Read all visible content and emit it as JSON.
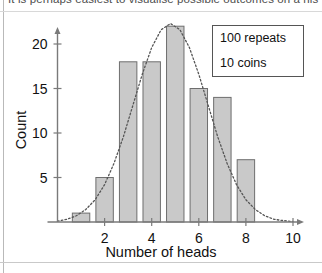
{
  "caption": {
    "text": "It is perhaps easiest to visualise possible outcomes on a his"
  },
  "legend": {
    "line1": "100 repeats",
    "line2": "10 coins"
  },
  "colors": {
    "bar_fill": "#c9c9c9",
    "bar_stroke": "#6e6e6e",
    "axis": "#7a7a7a",
    "curve": "#555555",
    "text": "#111111"
  },
  "chart_data": {
    "type": "bar",
    "title": "",
    "xlabel": "Number of heads",
    "ylabel": "Count",
    "categories": [
      1,
      2,
      3,
      4,
      5,
      6,
      7,
      8
    ],
    "values": [
      1,
      5,
      18,
      18,
      22,
      15,
      14,
      7
    ],
    "xlim": [
      0,
      10
    ],
    "ylim": [
      0,
      23
    ],
    "xticks": [
      2,
      4,
      6,
      8,
      10
    ],
    "xtick_labels": [
      "2",
      "4",
      "6",
      "8",
      "10"
    ],
    "yticks": [
      5,
      10,
      15,
      20
    ],
    "ytick_labels": [
      "5",
      "10",
      "15",
      "20"
    ],
    "grid": false,
    "legend_position": "top-right",
    "annotations": [
      "100 repeats",
      "10 coins"
    ],
    "overlay": {
      "type": "line",
      "style": "dotted",
      "name": "normal curve",
      "x": [
        0.0,
        0.4,
        0.8,
        1.2,
        1.6,
        2.0,
        2.4,
        2.8,
        3.2,
        3.6,
        4.0,
        4.4,
        4.8,
        5.2,
        5.6,
        6.0,
        6.4,
        6.8,
        7.2,
        7.6,
        8.0,
        8.4,
        8.8,
        9.2,
        9.6,
        10.0
      ],
      "y": [
        0.1,
        0.3,
        0.7,
        1.4,
        2.5,
        4.2,
        6.6,
        9.6,
        13.1,
        16.6,
        19.6,
        21.6,
        22.3,
        21.6,
        19.6,
        16.6,
        13.1,
        9.6,
        6.6,
        4.2,
        2.5,
        1.4,
        0.7,
        0.3,
        0.15,
        0.05
      ]
    }
  }
}
